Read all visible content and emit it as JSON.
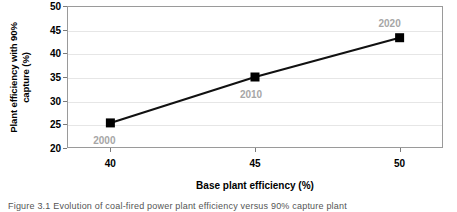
{
  "chart_data": {
    "type": "line",
    "title": "",
    "xlabel": "Base plant efficiency (%)",
    "ylabel": "Plant efficiency with 90% capture (%)",
    "ylabel_line1": "Plant efficiency with 90%",
    "ylabel_line2": "capture (%)",
    "x": [
      40,
      45,
      50
    ],
    "values": [
      25.3,
      35.0,
      43.3
    ],
    "point_labels": [
      "2000",
      "2010",
      "2020"
    ],
    "xlim": [
      38.5,
      51.5
    ],
    "ylim": [
      20,
      50
    ],
    "xticks": [
      "40",
      "45",
      "50"
    ],
    "yticks": [
      "20",
      "25",
      "30",
      "35",
      "40",
      "45",
      "50"
    ],
    "grid": "horizontal",
    "legend": "none",
    "marker": "square",
    "marker_color": "#000000",
    "line_color": "#000000",
    "label_color": "#a6a6a6",
    "gridline_color": "#e6e6e6",
    "frame_color": "#9a9a9a"
  },
  "caption": {
    "text": "Figure 3.1  Evolution of coal-fired power plant efficiency versus 90% capture plant"
  }
}
